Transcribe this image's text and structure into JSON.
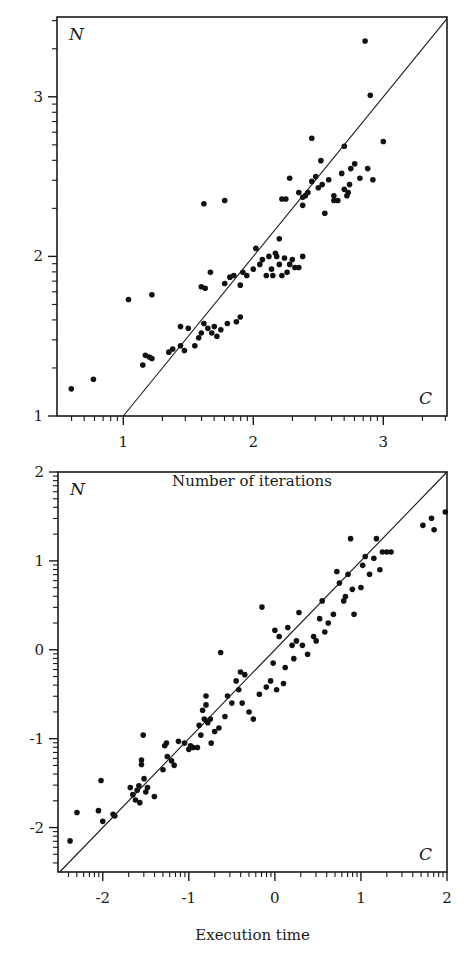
{
  "chart_data": [
    {
      "type": "scatter",
      "title": "",
      "xlabel": "Number of iterations",
      "ylabel": "",
      "corner_labels": {
        "top_left": "N",
        "bottom_right": "C"
      },
      "xlim": [
        0.49,
        3.49
      ],
      "ylim": [
        1.0,
        3.5
      ],
      "x_scale": "log10 (decade labels)",
      "y_scale": "log10 (decade labels)",
      "xticks": [
        1,
        2,
        3
      ],
      "xtick_labels": [
        "1",
        "2",
        "3"
      ],
      "yticks": [
        1,
        2,
        3
      ],
      "ytick_labels": [
        "1",
        "2",
        "3"
      ],
      "reference_line": "y = x",
      "grid": false,
      "legend": "none",
      "points": [
        [
          0.6,
          1.17
        ],
        [
          0.77,
          1.23
        ],
        [
          1.04,
          1.73
        ],
        [
          1.22,
          1.76
        ],
        [
          1.15,
          1.32
        ],
        [
          1.17,
          1.38
        ],
        [
          1.2,
          1.37
        ],
        [
          1.22,
          1.36
        ],
        [
          1.35,
          1.4
        ],
        [
          1.38,
          1.42
        ],
        [
          1.44,
          1.44
        ],
        [
          1.44,
          1.56
        ],
        [
          1.47,
          1.41
        ],
        [
          1.5,
          1.55
        ],
        [
          1.55,
          1.44
        ],
        [
          1.58,
          1.49
        ],
        [
          1.6,
          1.52
        ],
        [
          1.62,
          1.58
        ],
        [
          1.65,
          1.55
        ],
        [
          1.68,
          1.52
        ],
        [
          1.7,
          1.56
        ],
        [
          1.72,
          1.5
        ],
        [
          1.75,
          1.54
        ],
        [
          1.8,
          1.58
        ],
        [
          1.87,
          1.59
        ],
        [
          1.9,
          1.62
        ],
        [
          1.6,
          1.81
        ],
        [
          1.62,
          2.33
        ],
        [
          1.63,
          1.8
        ],
        [
          1.67,
          1.9
        ],
        [
          1.78,
          2.35
        ],
        [
          1.78,
          1.83
        ],
        [
          1.82,
          1.87
        ],
        [
          1.85,
          1.88
        ],
        [
          1.9,
          1.82
        ],
        [
          1.92,
          1.9
        ],
        [
          1.95,
          1.88
        ],
        [
          2.0,
          1.92
        ],
        [
          2.02,
          2.05
        ],
        [
          2.05,
          1.95
        ],
        [
          2.07,
          1.98
        ],
        [
          2.1,
          1.88
        ],
        [
          2.12,
          2.0
        ],
        [
          2.14,
          1.92
        ],
        [
          2.15,
          1.88
        ],
        [
          2.17,
          2.02
        ],
        [
          2.18,
          2.0
        ],
        [
          2.2,
          1.95
        ],
        [
          2.22,
          1.88
        ],
        [
          2.24,
          1.99
        ],
        [
          2.26,
          1.9
        ],
        [
          2.28,
          1.95
        ],
        [
          2.3,
          1.98
        ],
        [
          2.32,
          1.93
        ],
        [
          2.35,
          1.93
        ],
        [
          2.38,
          2.0
        ],
        [
          2.2,
          2.11
        ],
        [
          2.22,
          2.36
        ],
        [
          2.25,
          2.36
        ],
        [
          2.28,
          2.49
        ],
        [
          2.35,
          2.4
        ],
        [
          2.38,
          2.37
        ],
        [
          2.42,
          2.4
        ],
        [
          2.45,
          2.47
        ],
        [
          2.48,
          2.5
        ],
        [
          2.5,
          2.43
        ],
        [
          2.53,
          2.45
        ],
        [
          2.55,
          2.27
        ],
        [
          2.58,
          2.48
        ],
        [
          2.62,
          2.35
        ],
        [
          2.65,
          2.35
        ],
        [
          2.68,
          2.52
        ],
        [
          2.7,
          2.42
        ],
        [
          2.72,
          2.38
        ],
        [
          2.74,
          2.45
        ],
        [
          2.45,
          2.74
        ],
        [
          2.52,
          2.6
        ],
        [
          2.7,
          2.69
        ],
        [
          2.75,
          2.55
        ],
        [
          2.78,
          2.58
        ],
        [
          2.82,
          2.49
        ],
        [
          2.88,
          2.55
        ],
        [
          2.92,
          2.48
        ],
        [
          3.0,
          2.72
        ],
        [
          2.86,
          3.35
        ],
        [
          2.9,
          3.01
        ],
        [
          2.38,
          2.32
        ],
        [
          2.62,
          2.38
        ],
        [
          2.73,
          2.4
        ],
        [
          2.4,
          2.38
        ]
      ]
    },
    {
      "type": "scatter",
      "title": "",
      "xlabel": "Execution time",
      "ylabel": "",
      "corner_labels": {
        "top_left": "N",
        "bottom_right": "C"
      },
      "xlim": [
        -2.52,
        2.0
      ],
      "ylim": [
        -2.5,
        2.0
      ],
      "x_scale": "log10 (decade labels)",
      "y_scale": "log10 (decade labels)",
      "xticks": [
        -2,
        -1,
        0,
        1,
        2
      ],
      "xtick_labels": [
        "-2",
        "-1",
        "0",
        "1",
        "2"
      ],
      "yticks": [
        -2,
        -1,
        0,
        1,
        2
      ],
      "ytick_labels": [
        "-2",
        "-1",
        "0",
        "1",
        "2"
      ],
      "reference_line": "y = x",
      "grid": false,
      "legend": "none",
      "points": [
        [
          -2.38,
          -2.15
        ],
        [
          -2.3,
          -1.83
        ],
        [
          -2.05,
          -1.81
        ],
        [
          -2.02,
          -1.47
        ],
        [
          -2.0,
          -1.93
        ],
        [
          -1.88,
          -1.85
        ],
        [
          -1.86,
          -1.87
        ],
        [
          -1.68,
          -1.55
        ],
        [
          -1.65,
          -1.63
        ],
        [
          -1.62,
          -1.69
        ],
        [
          -1.6,
          -1.58
        ],
        [
          -1.58,
          -1.53
        ],
        [
          -1.57,
          -1.72
        ],
        [
          -1.55,
          -1.29
        ],
        [
          -1.55,
          -1.24
        ],
        [
          -1.53,
          -0.96
        ],
        [
          -1.52,
          -1.45
        ],
        [
          -1.5,
          -1.6
        ],
        [
          -1.48,
          -1.55
        ],
        [
          -1.4,
          -1.65
        ],
        [
          -1.3,
          -1.35
        ],
        [
          -1.28,
          -1.08
        ],
        [
          -1.26,
          -1.05
        ],
        [
          -1.25,
          -1.2
        ],
        [
          -1.2,
          -1.25
        ],
        [
          -1.17,
          -1.3
        ],
        [
          -1.12,
          -1.03
        ],
        [
          -1.05,
          -1.05
        ],
        [
          -1.0,
          -1.12
        ],
        [
          -0.98,
          -1.08
        ],
        [
          -0.95,
          -1.1
        ],
        [
          -0.9,
          -1.1
        ],
        [
          -0.88,
          -0.85
        ],
        [
          -0.86,
          -0.96
        ],
        [
          -0.84,
          -0.68
        ],
        [
          -0.82,
          -0.78
        ],
        [
          -0.8,
          -0.52
        ],
        [
          -0.8,
          -0.62
        ],
        [
          -0.78,
          -0.82
        ],
        [
          -0.75,
          -0.78
        ],
        [
          -0.74,
          -1.05
        ],
        [
          -0.7,
          -0.92
        ],
        [
          -0.65,
          -0.88
        ],
        [
          -0.63,
          -0.03
        ],
        [
          -0.58,
          -0.75
        ],
        [
          -0.55,
          -0.52
        ],
        [
          -0.5,
          -0.6
        ],
        [
          -0.45,
          -0.35
        ],
        [
          -0.42,
          -0.45
        ],
        [
          -0.4,
          -0.25
        ],
        [
          -0.38,
          -0.6
        ],
        [
          -0.35,
          -0.28
        ],
        [
          -0.3,
          -0.7
        ],
        [
          -0.25,
          -0.78
        ],
        [
          -0.18,
          -0.5
        ],
        [
          -0.15,
          0.48
        ],
        [
          -0.1,
          -0.42
        ],
        [
          -0.05,
          -0.35
        ],
        [
          -0.02,
          -0.15
        ],
        [
          0.0,
          0.22
        ],
        [
          0.02,
          -0.45
        ],
        [
          0.05,
          0.15
        ],
        [
          0.1,
          -0.38
        ],
        [
          0.12,
          -0.2
        ],
        [
          0.15,
          0.25
        ],
        [
          0.2,
          0.05
        ],
        [
          0.22,
          -0.1
        ],
        [
          0.25,
          0.1
        ],
        [
          0.28,
          0.42
        ],
        [
          0.32,
          0.05
        ],
        [
          0.38,
          -0.05
        ],
        [
          0.45,
          0.15
        ],
        [
          0.48,
          0.1
        ],
        [
          0.52,
          0.35
        ],
        [
          0.55,
          0.55
        ],
        [
          0.58,
          0.2
        ],
        [
          0.62,
          0.3
        ],
        [
          0.68,
          0.4
        ],
        [
          0.72,
          0.88
        ],
        [
          0.75,
          0.75
        ],
        [
          0.8,
          0.55
        ],
        [
          0.82,
          0.6
        ],
        [
          0.85,
          0.85
        ],
        [
          0.88,
          1.25
        ],
        [
          0.9,
          0.68
        ],
        [
          0.92,
          0.4
        ],
        [
          1.0,
          0.7
        ],
        [
          1.02,
          0.95
        ],
        [
          1.05,
          1.05
        ],
        [
          1.1,
          0.85
        ],
        [
          1.15,
          1.03
        ],
        [
          1.18,
          1.25
        ],
        [
          1.22,
          0.9
        ],
        [
          1.25,
          1.1
        ],
        [
          1.3,
          1.1
        ],
        [
          1.35,
          1.1
        ],
        [
          1.72,
          1.4
        ],
        [
          1.82,
          1.48
        ],
        [
          1.85,
          1.35
        ],
        [
          1.98,
          1.55
        ]
      ]
    }
  ]
}
